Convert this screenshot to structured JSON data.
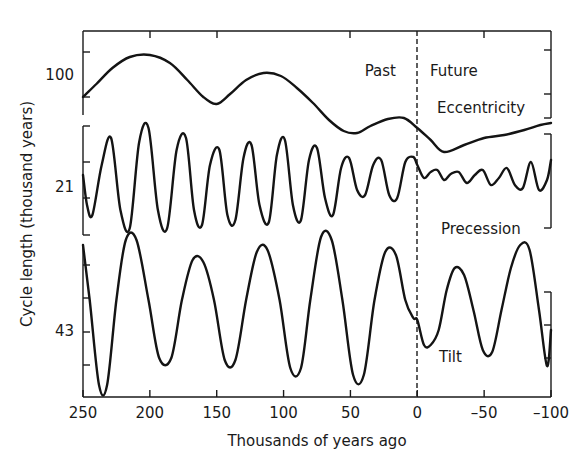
{
  "chart_data": {
    "type": "line",
    "title": "",
    "xlabel": "Thousands of years ago",
    "ylabel": "Cycle length (thousand years)",
    "xlim": [
      250,
      -100
    ],
    "x_ticks": [
      250,
      200,
      150,
      100,
      50,
      0,
      -50,
      -100
    ],
    "x_tick_labels": [
      "250",
      "200",
      "150",
      "100",
      "50",
      "0",
      "–50",
      "–100"
    ],
    "annotations": {
      "past": "Past",
      "future": "Future",
      "divider_at": 0
    },
    "grid": false,
    "legend": "none (inline panel labels)",
    "series": [
      {
        "name": "Eccentricity",
        "panel_tick_label": "100",
        "x": [
          250,
          240,
          228,
          215,
          200,
          185,
          172,
          160,
          150,
          140,
          128,
          115,
          102,
          90,
          78,
          66,
          55,
          45,
          35,
          22,
          10,
          0,
          -10,
          -20,
          -35,
          -50,
          -65,
          -80,
          -92,
          -100
        ],
        "y_px": [
          97,
          84,
          68,
          57,
          55,
          63,
          80,
          97,
          104,
          94,
          80,
          73,
          76,
          88,
          103,
          120,
          131,
          133,
          126,
          119,
          118,
          128,
          140,
          152,
          145,
          138,
          135,
          130,
          125,
          123
        ]
      },
      {
        "name": "Precession",
        "panel_tick_label": "21",
        "x": [
          250,
          247,
          243,
          236,
          229,
          222,
          215,
          208,
          201,
          194,
          187,
          180,
          173,
          167,
          161,
          155,
          148,
          142,
          136,
          130,
          124,
          118,
          111,
          105,
          99,
          93,
          87,
          81,
          75,
          69,
          63,
          57,
          51,
          45,
          39,
          33,
          27,
          21,
          15,
          9,
          3,
          0,
          -5,
          -10,
          -15,
          -20,
          -25,
          -31,
          -37,
          -43,
          -49,
          -55,
          -61,
          -67,
          -73,
          -79,
          -85,
          -91,
          -97,
          -100
        ],
        "y_px": [
          175,
          205,
          215,
          165,
          138,
          210,
          228,
          142,
          128,
          210,
          228,
          150,
          138,
          210,
          225,
          165,
          150,
          215,
          220,
          158,
          145,
          205,
          222,
          155,
          140,
          205,
          220,
          160,
          148,
          198,
          215,
          168,
          158,
          190,
          195,
          165,
          160,
          195,
          198,
          162,
          157,
          165,
          178,
          172,
          170,
          180,
          174,
          172,
          183,
          175,
          170,
          185,
          178,
          168,
          185,
          188,
          162,
          190,
          180,
          160
        ]
      },
      {
        "name": "Tilt",
        "panel_tick_label": "43",
        "x": [
          250,
          245,
          238,
          232,
          225,
          218,
          210,
          201,
          193,
          184,
          176,
          168,
          160,
          152,
          144,
          136,
          128,
          120,
          112,
          103,
          95,
          87,
          80,
          72,
          64,
          56,
          48,
          40,
          32,
          24,
          16,
          9,
          3,
          0,
          -5,
          -10,
          -16,
          -22,
          -28,
          -35,
          -42,
          -49,
          -56,
          -63,
          -70,
          -77,
          -84,
          -91,
          -97,
          -100
        ],
        "y_px": [
          245,
          300,
          385,
          385,
          300,
          240,
          240,
          300,
          358,
          358,
          300,
          260,
          262,
          300,
          360,
          360,
          300,
          252,
          250,
          300,
          368,
          368,
          300,
          237,
          240,
          300,
          375,
          375,
          300,
          252,
          255,
          300,
          318,
          320,
          345,
          345,
          330,
          290,
          268,
          275,
          310,
          350,
          352,
          310,
          268,
          245,
          250,
          310,
          366,
          330
        ]
      }
    ]
  },
  "labels": {
    "past": "Past",
    "future": "Future",
    "eccentricity": "Eccentricity",
    "precession": "Precession",
    "tilt": "Tilt",
    "tick_100": "100",
    "tick_21": "21",
    "tick_43": "43",
    "xlabel": "Thousands of years ago",
    "ylabel": "Cycle length (thousand years)",
    "x_tick_labels": [
      "250",
      "200",
      "150",
      "100",
      "50",
      "0",
      "–50",
      "–100"
    ]
  }
}
